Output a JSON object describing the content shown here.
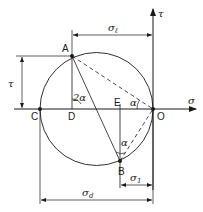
{
  "diagram": {
    "type": "Mohr circle",
    "colors": {
      "ink": "#1a1a1a",
      "background": "#ffffff"
    },
    "axes": {
      "horizontal": {
        "label": "σ"
      },
      "vertical": {
        "label": "τ"
      }
    },
    "points": {
      "A": "A",
      "B": "B",
      "C": "C",
      "D": "D",
      "E": "E",
      "O": "O"
    },
    "angles": {
      "at_D": "2α",
      "at_O": "α",
      "at_B": "α"
    },
    "dimensions": {
      "sigma_l": {
        "symbol": "σ",
        "subscript": "ℓ"
      },
      "tau": {
        "symbol": "τ"
      },
      "sigma_1": {
        "symbol": "σ",
        "subscript": "1"
      },
      "sigma_d": {
        "symbol": "σ",
        "subscript": "d"
      }
    }
  }
}
